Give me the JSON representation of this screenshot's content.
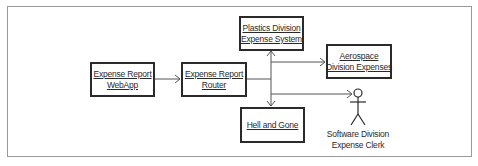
{
  "diagram": {
    "type": "uml-object-collaboration",
    "colors": {
      "line": "#2a2a2a",
      "arrow": "#555555",
      "frame": "#9a9a9a",
      "background": "#ffffff"
    },
    "nodes": [
      {
        "id": "webapp",
        "kind": "object",
        "line1": "Expense Report",
        "line2": "WebApp"
      },
      {
        "id": "router",
        "kind": "object",
        "line1": "Expense Report",
        "line2": "Router"
      },
      {
        "id": "plastics",
        "kind": "object",
        "line1": "Plastics Division",
        "line2": "Expense System"
      },
      {
        "id": "aerospace",
        "kind": "object",
        "line1": "Aerospace",
        "line2": "Division Expenses"
      },
      {
        "id": "hell",
        "kind": "object",
        "line1": "Hell and Gone"
      },
      {
        "id": "clerk",
        "kind": "actor",
        "line1": "Software Division",
        "line2": "Expense Clerk"
      }
    ],
    "edges": [
      {
        "from": "webapp",
        "to": "router",
        "style": "open-arrow"
      },
      {
        "from": "router",
        "to": "plastics",
        "style": "open-arrow"
      },
      {
        "from": "router",
        "to": "aerospace",
        "style": "open-arrow"
      },
      {
        "from": "router",
        "to": "hell",
        "style": "open-arrow"
      },
      {
        "from": "router",
        "to": "clerk",
        "style": "open-arrow"
      }
    ]
  }
}
